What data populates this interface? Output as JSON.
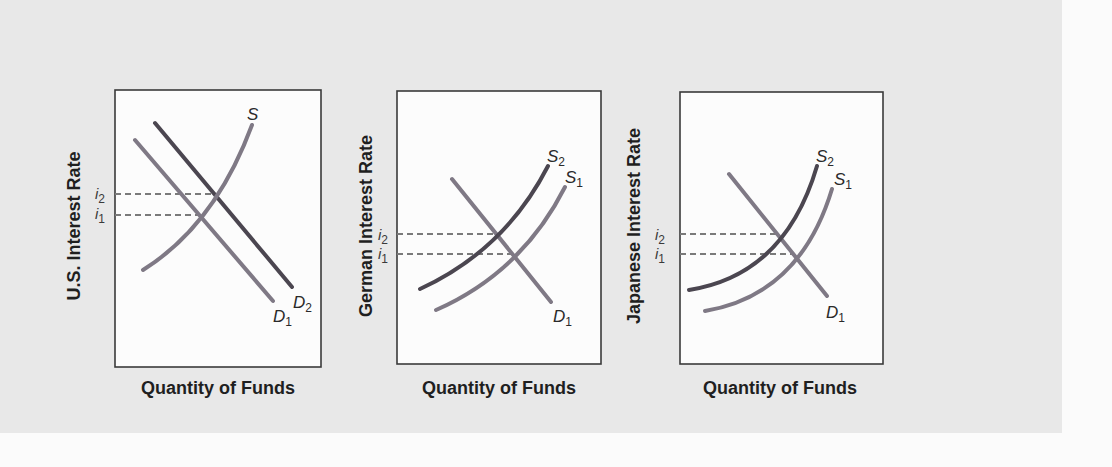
{
  "colors": {
    "background": "#e8e8e8",
    "page": "#fbfbfb",
    "box_fill": "#fcfcfc",
    "box_stroke": "#3a3a3a",
    "dark_line": "#4b4650",
    "light_line": "#7f7985",
    "dash": "#7a7a7a"
  },
  "panels": [
    {
      "id": "us",
      "ylabel": "U.S. Interest Rate",
      "xlabel": "Quantity of Funds",
      "box": {
        "x": 115,
        "y": 90,
        "w": 206,
        "h": 277
      },
      "ylabel_pos": {
        "x": 80,
        "y": 226
      },
      "xlabel_pos": {
        "x": 218,
        "y": 394
      },
      "i_labels": [
        {
          "text": "i",
          "sub": "2",
          "x": 95,
          "y": 199
        },
        {
          "text": "i",
          "sub": "1",
          "x": 95,
          "y": 219
        }
      ],
      "dashes": [
        {
          "y": 194,
          "x1": 115,
          "x2": 212
        },
        {
          "y": 215,
          "x1": 115,
          "x2": 198
        }
      ],
      "lines": [
        {
          "name": "D1",
          "kind": "demand",
          "shade": "light",
          "path": "M135 140 L273 301",
          "label": {
            "text": "D",
            "sub": "1",
            "x": 273,
            "y": 322
          }
        },
        {
          "name": "D2",
          "kind": "demand",
          "shade": "dark",
          "path": "M155 123 L292 287",
          "label": {
            "text": "D",
            "sub": "2",
            "x": 293,
            "y": 308
          }
        },
        {
          "name": "S",
          "kind": "supply",
          "shade": "light",
          "path": "M143 270 Q215 225 252 125",
          "label": {
            "text": "S",
            "sub": "",
            "x": 247,
            "y": 120
          }
        }
      ]
    },
    {
      "id": "german",
      "ylabel": "German Interest Rate",
      "xlabel": "Quantity of Funds",
      "box": {
        "x": 397,
        "y": 91,
        "w": 204,
        "h": 273
      },
      "ylabel_pos": {
        "x": 372,
        "y": 226
      },
      "xlabel_pos": {
        "x": 499,
        "y": 394
      },
      "i_labels": [
        {
          "text": "i",
          "sub": "2",
          "x": 378,
          "y": 240
        },
        {
          "text": "i",
          "sub": "1",
          "x": 378,
          "y": 259
        }
      ],
      "dashes": [
        {
          "y": 234,
          "x1": 397,
          "x2": 496
        },
        {
          "y": 254,
          "x1": 397,
          "x2": 512
        }
      ],
      "lines": [
        {
          "name": "D1",
          "kind": "demand",
          "shade": "light",
          "path": "M452 179 L551 302",
          "label": {
            "text": "D",
            "sub": "1",
            "x": 553,
            "y": 322
          }
        },
        {
          "name": "S2",
          "kind": "supply",
          "shade": "dark",
          "path": "M420 289 Q505 250 548 166",
          "label": {
            "text": "S",
            "sub": "2",
            "x": 547,
            "y": 162
          }
        },
        {
          "name": "S1",
          "kind": "supply",
          "shade": "light",
          "path": "M436 310 Q522 272 565 187",
          "label": {
            "text": "S",
            "sub": "1",
            "x": 565,
            "y": 183
          }
        }
      ]
    },
    {
      "id": "japanese",
      "ylabel": "Japanese Interest Rate",
      "xlabel": "Quantity of Funds",
      "box": {
        "x": 680,
        "y": 92,
        "w": 203,
        "h": 272
      },
      "ylabel_pos": {
        "x": 640,
        "y": 226
      },
      "xlabel_pos": {
        "x": 780,
        "y": 394
      },
      "i_labels": [
        {
          "text": "i",
          "sub": "2",
          "x": 655,
          "y": 240
        },
        {
          "text": "i",
          "sub": "1",
          "x": 655,
          "y": 259
        }
      ],
      "dashes": [
        {
          "y": 234,
          "x1": 680,
          "x2": 778
        },
        {
          "y": 254,
          "x1": 680,
          "x2": 795
        }
      ],
      "lines": [
        {
          "name": "D1",
          "kind": "demand",
          "shade": "light",
          "path": "M729 174 L827 296",
          "label": {
            "text": "D",
            "sub": "1",
            "x": 826,
            "y": 318
          }
        },
        {
          "name": "S2",
          "kind": "supply",
          "shade": "dark",
          "path": "M689 290 Q785 275 817 166",
          "label": {
            "text": "S",
            "sub": "2",
            "x": 816,
            "y": 162
          }
        },
        {
          "name": "S1",
          "kind": "supply",
          "shade": "light",
          "path": "M705 311 Q800 295 832 189",
          "label": {
            "text": "S",
            "sub": "1",
            "x": 834,
            "y": 185
          }
        }
      ]
    }
  ]
}
